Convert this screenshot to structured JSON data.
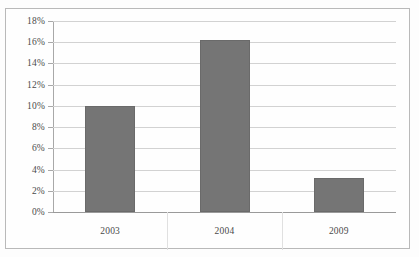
{
  "chart_data": {
    "type": "bar",
    "title": "",
    "subtitle": "",
    "xlabel": "",
    "ylabel": "",
    "categories": [
      "2003",
      "2004",
      "2009"
    ],
    "values": [
      10.0,
      16.2,
      3.2
    ],
    "series": [
      {
        "name": "",
        "values": [
          10.0,
          16.2,
          3.2
        ]
      }
    ],
    "ylim": [
      0,
      18
    ],
    "ytick_step": 2,
    "ytick_labels": [
      "0%",
      "2%",
      "4%",
      "6%",
      "8%",
      "10%",
      "12%",
      "14%",
      "16%",
      "18%"
    ],
    "ytick_values": [
      0,
      2,
      4,
      6,
      8,
      10,
      12,
      14,
      16,
      18
    ],
    "value_format": "percent",
    "grid": true,
    "grid_axis": "y",
    "legend": false,
    "legend_position": "none",
    "annotations": [],
    "colors": {
      "bar_fill": "#757575",
      "bar_border": "#6a6a6a",
      "gridline": "#d2d2d2",
      "axis": "#a8a8a8",
      "baseline": "#9a9a9a",
      "text": "#4a4a4a",
      "frame_border": "#b9b9b9",
      "background": "#fefefe"
    }
  }
}
